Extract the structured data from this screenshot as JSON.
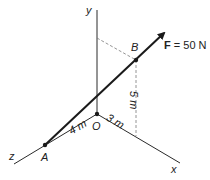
{
  "diagram": {
    "axes": {
      "x_label": "x",
      "y_label": "y",
      "z_label": "z",
      "origin_label": "O"
    },
    "points": {
      "A": "A",
      "B": "B"
    },
    "force": {
      "symbol": "F",
      "value": " = 50 N"
    },
    "dimensions": {
      "z_dim": "4 m",
      "x_dim": "3 m",
      "y_dim": "5 m"
    },
    "colors": {
      "line": "#2a2a2a",
      "dashed": "#7a7a7a"
    }
  }
}
